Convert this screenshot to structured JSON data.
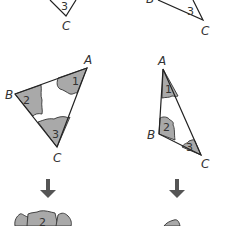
{
  "diagram": {
    "title": "",
    "colors": {
      "piece_fill": "#a9a9a9",
      "stroke": "#222222",
      "arrow": "#555555",
      "background": "#ffffff"
    },
    "top_left": {
      "angle_label": "3",
      "vertex_label": "C"
    },
    "top_right": {
      "vertex_b": "B",
      "angle_label": "3",
      "vertex_label": "C"
    },
    "left_triangle": {
      "vertices": {
        "A": "A",
        "B": "B",
        "C": "C"
      },
      "angles": {
        "a1": "1",
        "a2": "2",
        "a3": "3"
      }
    },
    "right_triangle": {
      "vertices": {
        "A": "A",
        "B": "B",
        "C": "C"
      },
      "angles": {
        "a1": "1",
        "a2": "2",
        "a3": "3"
      }
    },
    "arrows": {
      "left": "down-arrow",
      "right": "down-arrow"
    },
    "bottom_left": {
      "angle_label": "2"
    }
  }
}
